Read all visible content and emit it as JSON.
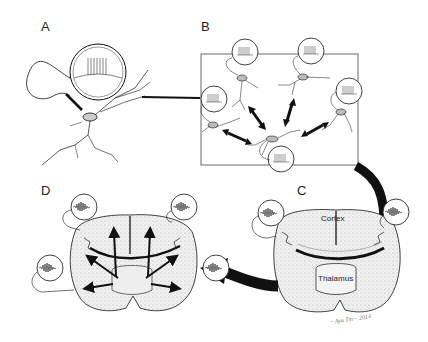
{
  "figure": {
    "panels": [
      {
        "id": "A",
        "label": "A",
        "description": "single neuron with recording electrode and magnified spike-train trace"
      },
      {
        "id": "B",
        "label": "B",
        "description": "network of neurons with bidirectional connections, each with spike-train trace"
      },
      {
        "id": "C",
        "label": "C",
        "description": "coronal brain section with cortex and thalamus, oscillatory LFP traces"
      },
      {
        "id": "D",
        "label": "D",
        "description": "coronal brain section with propagating oscillatory activity arrows"
      }
    ],
    "region_labels": {
      "cortex": "Cortex",
      "thalamus": "Thalamus"
    },
    "signature": "~ Ayu Tm ~ 2014",
    "colors": {
      "ink": "#111111",
      "tissue_fill": "#e8e8e8",
      "background": "#ffffff"
    }
  }
}
